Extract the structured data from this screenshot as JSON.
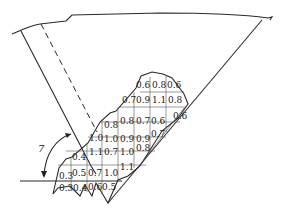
{
  "diagram": {
    "type": "slope cross-section with grid of values",
    "angle_label": "7",
    "grid_values": [
      {
        "row": 0,
        "cells": [
          {
            "col": 5,
            "v": "0.6"
          },
          {
            "col": 6,
            "v": "0.8"
          },
          {
            "col": 7,
            "v": "0.6"
          }
        ]
      },
      {
        "row": 1,
        "cells": [
          {
            "col": 4,
            "v": "0.7"
          },
          {
            "col": 5,
            "v": "0.9"
          },
          {
            "col": 6,
            "v": "1.1"
          },
          {
            "col": 7,
            "v": "0.8"
          }
        ]
      },
      {
        "row": 2,
        "cells": [
          {
            "col": 3,
            "v": "0.8"
          },
          {
            "col": 4,
            "v": "0.8"
          },
          {
            "col": 5,
            "v": "0.7"
          },
          {
            "col": 6,
            "v": "0.6"
          },
          {
            "col": 7,
            "v": "0.6"
          }
        ]
      },
      {
        "row": 3,
        "cells": [
          {
            "col": 2,
            "v": "1.0"
          },
          {
            "col": 3,
            "v": "1.0"
          },
          {
            "col": 4,
            "v": "0.9"
          },
          {
            "col": 5,
            "v": "0.9"
          },
          {
            "col": 6,
            "v": "0.7"
          }
        ]
      },
      {
        "row": 4,
        "cells": [
          {
            "col": 1,
            "v": "0.4"
          },
          {
            "col": 2,
            "v": "1.1"
          },
          {
            "col": 3,
            "v": "0.7"
          },
          {
            "col": 4,
            "v": "1.0"
          },
          {
            "col": 5,
            "v": "0.8"
          }
        ]
      },
      {
        "row": 5,
        "cells": [
          {
            "col": 0,
            "v": "0.3"
          },
          {
            "col": 1,
            "v": "0.5"
          },
          {
            "col": 2,
            "v": "0.7"
          },
          {
            "col": 3,
            "v": "1.0"
          },
          {
            "col": 4,
            "v": "1.1"
          }
        ]
      },
      {
        "row": 6,
        "cells": [
          {
            "col": 0,
            "v": "0.3"
          },
          {
            "col": 1,
            "v": "0.4"
          },
          {
            "col": 2,
            "v": "0.6"
          },
          {
            "col": 3,
            "v": "0.5"
          }
        ]
      }
    ]
  },
  "labels": {
    "r0c5": "0.6",
    "r0c6": "0.8",
    "r0c7": "0.6",
    "r1c4": "0.7",
    "r1c5": "0.9",
    "r1c6": "1.1",
    "r1c7": "0.8",
    "r2c3": "0.8",
    "r2c4": "0.8",
    "r2c5": "0.7",
    "r2c6": "0.6",
    "r2c7": "0.6",
    "r3c2": "1.0",
    "r3c3": "1.0",
    "r3c4": "0.9",
    "r3c5": "0.9",
    "r3c6": "0.7",
    "r4c1": "0.4",
    "r4c2": "1.1",
    "r4c3": "0.7",
    "r4c4": "1.0",
    "r4c5": "0.8",
    "r5c0": "0.3",
    "r5c1": "0.5",
    "r5c2": "0.7",
    "r5c3": "1.0",
    "r5c4": "1.1",
    "r6c0": "0.3",
    "r6c1": "0.4",
    "r6c2": "0.6",
    "r6c3": "0.5"
  }
}
